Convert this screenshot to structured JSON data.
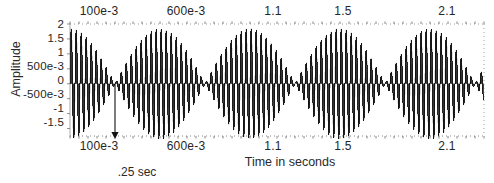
{
  "figure": {
    "title": "",
    "ylabel": "Amplitude",
    "xlabel": "Time in seconds",
    "annotation": ".25 sec"
  },
  "axes": {
    "y_ticks": [
      "2",
      "1.5",
      "1",
      "500e-3",
      "0",
      "-500e-3",
      "-1",
      "-1.5"
    ],
    "x_ticks_top": [
      "100e-3",
      "600e-3",
      "1.1",
      "1.5",
      "2.1"
    ],
    "x_ticks_bottom": [
      "100e-3",
      "600e-3",
      "1.1",
      "1.5",
      "2.1"
    ]
  },
  "colors": {
    "ink": "#1b1b1b",
    "trace": "#111111",
    "axis": "#555555",
    "background": "#ffffff"
  },
  "chart_data": {
    "type": "line",
    "title": "",
    "xlabel": "Time in seconds",
    "ylabel": "Amplitude",
    "xlim": [
      0.0,
      2.3
    ],
    "ylim": [
      -1.75,
      2.0
    ],
    "grid": false,
    "legend": null,
    "x_tick_values": [
      0.1,
      0.6,
      1.1,
      1.5,
      2.1
    ],
    "x_tick_labels": [
      "100e-3",
      "600e-3",
      "1.1",
      "1.5",
      "2.1"
    ],
    "y_tick_values": [
      2,
      1.5,
      1,
      0.5,
      0,
      -0.5,
      -1,
      -1.5
    ],
    "y_tick_labels": [
      "2",
      "1.5",
      "1",
      "500e-3",
      "0",
      "-500e-3",
      "-1",
      "-1.5"
    ],
    "signal": {
      "model": "A*cos(2*pi*f_beat*t)*sin(2*pi*f_carrier*t)",
      "amplitude": 1.85,
      "carrier_hz": 36,
      "beat_hz": 2.0,
      "envelope_period_s": 0.5,
      "node_period_s": 0.25,
      "node_times_s": [
        0.25,
        0.75,
        1.25,
        1.75,
        2.25
      ],
      "antinode_times_s": [
        0.0,
        0.5,
        1.0,
        1.5,
        2.0
      ],
      "lobe_count": 5,
      "samples_drawn": 1400
    },
    "annotations": [
      {
        "text": ".25 sec",
        "type": "arrow",
        "x": 0.25,
        "y_from": 0.0,
        "y_to": -1.75,
        "points_to": "first envelope node"
      }
    ]
  }
}
